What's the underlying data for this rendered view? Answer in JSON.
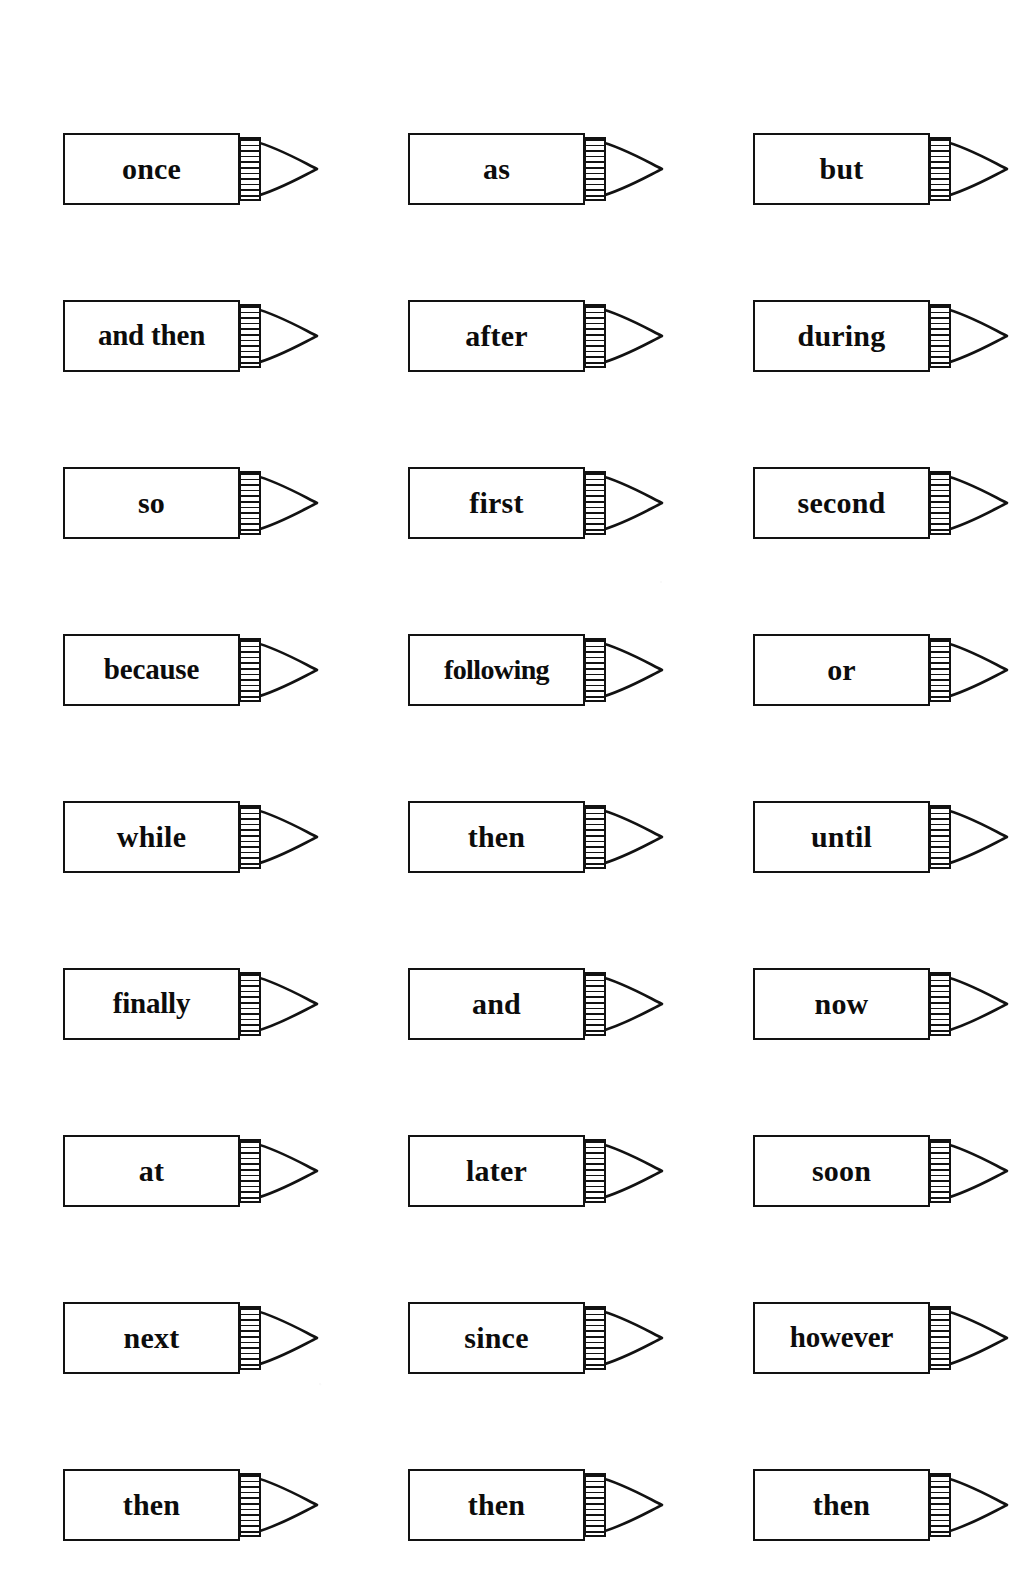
{
  "page": {
    "background_color": "#ffffff",
    "ink_color": "#121212",
    "columns": 3,
    "rows": 9
  },
  "pencil": {
    "body_shape": "rectangle",
    "ferrule_shape": "striped-band",
    "tip_shape": "lens-point",
    "stripe_count": 11
  },
  "cards": [
    {
      "row": 1,
      "col": 1,
      "word": "once"
    },
    {
      "row": 1,
      "col": 2,
      "word": "as"
    },
    {
      "row": 1,
      "col": 3,
      "word": "but"
    },
    {
      "row": 2,
      "col": 1,
      "word": "and then"
    },
    {
      "row": 2,
      "col": 2,
      "word": "after"
    },
    {
      "row": 2,
      "col": 3,
      "word": "during"
    },
    {
      "row": 3,
      "col": 1,
      "word": "so"
    },
    {
      "row": 3,
      "col": 2,
      "word": "first"
    },
    {
      "row": 3,
      "col": 3,
      "word": "second"
    },
    {
      "row": 4,
      "col": 1,
      "word": "because"
    },
    {
      "row": 4,
      "col": 2,
      "word": "following"
    },
    {
      "row": 4,
      "col": 3,
      "word": "or"
    },
    {
      "row": 5,
      "col": 1,
      "word": "while"
    },
    {
      "row": 5,
      "col": 2,
      "word": "then"
    },
    {
      "row": 5,
      "col": 3,
      "word": "until"
    },
    {
      "row": 6,
      "col": 1,
      "word": "finally"
    },
    {
      "row": 6,
      "col": 2,
      "word": "and"
    },
    {
      "row": 6,
      "col": 3,
      "word": "now"
    },
    {
      "row": 7,
      "col": 1,
      "word": "at"
    },
    {
      "row": 7,
      "col": 2,
      "word": "later"
    },
    {
      "row": 7,
      "col": 3,
      "word": "soon"
    },
    {
      "row": 8,
      "col": 1,
      "word": "next"
    },
    {
      "row": 8,
      "col": 2,
      "word": "since"
    },
    {
      "row": 8,
      "col": 3,
      "word": "however"
    },
    {
      "row": 9,
      "col": 1,
      "word": "then"
    },
    {
      "row": 9,
      "col": 2,
      "word": "then"
    },
    {
      "row": 9,
      "col": 3,
      "word": "then"
    }
  ]
}
